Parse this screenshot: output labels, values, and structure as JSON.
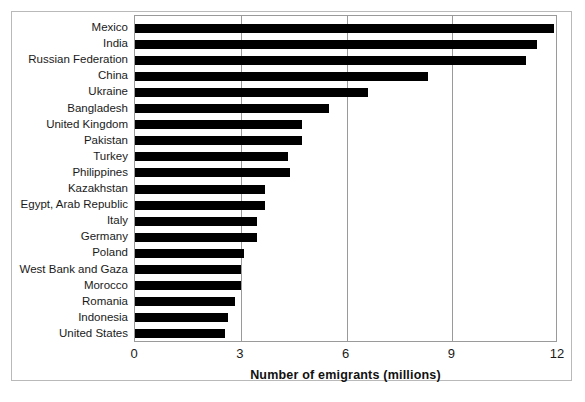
{
  "chart_data": {
    "type": "bar",
    "orientation": "horizontal",
    "title": "",
    "xlabel": "Number of emigrants (millions)",
    "ylabel": "",
    "xlim": [
      0,
      12
    ],
    "xticks": [
      "0",
      "3",
      "6",
      "9",
      "12"
    ],
    "xtick_values": [
      0,
      3,
      6,
      9,
      12
    ],
    "grid": "vertical",
    "legend": "none",
    "bar_color": "#000000",
    "categories": [
      "Mexico",
      "India",
      "Russian Federation",
      "China",
      "Ukraine",
      "Bangladesh",
      "United Kingdom",
      "Pakistan",
      "Turkey",
      "Philippines",
      "Kazakhstan",
      "Egypt, Arab Republic",
      "Italy",
      "Germany",
      "Poland",
      "West Bank and Gaza",
      "Morocco",
      "Romania",
      "Indonesia",
      "United States"
    ],
    "values": [
      11.9,
      11.4,
      11.1,
      8.3,
      6.6,
      5.5,
      4.75,
      4.75,
      4.35,
      4.4,
      3.7,
      3.7,
      3.45,
      3.45,
      3.1,
      3.0,
      3.0,
      2.85,
      2.65,
      2.55
    ]
  },
  "axis": {
    "x_title": "Number of emigrants (millions)"
  }
}
